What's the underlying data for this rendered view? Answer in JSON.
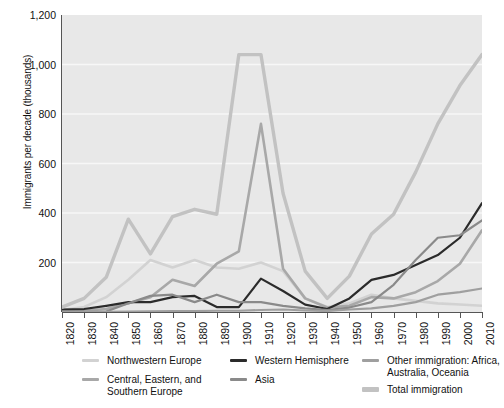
{
  "chart_data": {
    "type": "line",
    "title": "",
    "xlabel": "",
    "ylabel": "Immigrants per decade (thousands)",
    "xlim": [
      1820,
      2010
    ],
    "ylim": [
      0,
      1200
    ],
    "grid": true,
    "legend_position": "bottom",
    "x": [
      1820,
      1830,
      1840,
      1850,
      1860,
      1870,
      1880,
      1890,
      1900,
      1910,
      1920,
      1930,
      1940,
      1950,
      1960,
      1970,
      1980,
      1990,
      2000,
      2010
    ],
    "xticklabels": [
      "1820",
      "1830",
      "1840",
      "1850",
      "1860",
      "1870",
      "1880",
      "1890",
      "1900",
      "1910",
      "1920",
      "1930",
      "1940",
      "1950",
      "1960",
      "1970",
      "1980",
      "1990",
      "2000",
      "2010"
    ],
    "yticklabels": [
      "0",
      "200",
      "400",
      "600",
      "800",
      "1,000",
      "1,200"
    ],
    "ytickvalues": [
      0,
      200,
      400,
      600,
      800,
      1000,
      1200
    ],
    "series": [
      {
        "name": "Northwestern Europe",
        "color": "#d2d2d2",
        "width": 2.6,
        "values": [
          8,
          20,
          60,
          130,
          210,
          180,
          210,
          180,
          175,
          200,
          165,
          55,
          20,
          35,
          70,
          55,
          45,
          35,
          30,
          25
        ]
      },
      {
        "name": "Central, Eastern, and Southern Europe",
        "color": "#a8a8a8",
        "width": 2.6,
        "values": [
          2,
          5,
          12,
          35,
          60,
          130,
          105,
          195,
          245,
          760,
          175,
          55,
          18,
          25,
          60,
          55,
          80,
          125,
          195,
          330
        ]
      },
      {
        "name": "Western Hemisphere",
        "color": "#2b2b2b",
        "width": 2.2,
        "values": [
          10,
          12,
          25,
          40,
          40,
          60,
          65,
          20,
          20,
          135,
          85,
          30,
          12,
          55,
          130,
          150,
          190,
          230,
          300,
          440
        ]
      },
      {
        "name": "Asia",
        "color": "#8a8a8a",
        "width": 2.2,
        "values": [
          1,
          1,
          2,
          35,
          65,
          70,
          40,
          70,
          40,
          40,
          25,
          15,
          8,
          18,
          40,
          110,
          210,
          300,
          310,
          370
        ]
      },
      {
        "name": "Other immigration: Africa, Australia, Oceania",
        "color": "#9f9f9f",
        "width": 2.2,
        "values": [
          1,
          1,
          1,
          2,
          3,
          4,
          4,
          5,
          5,
          8,
          10,
          6,
          4,
          10,
          15,
          25,
          40,
          70,
          80,
          95
        ]
      },
      {
        "name": "Total immigration",
        "color": "#c2c2c2",
        "width": 3.4,
        "values": [
          20,
          55,
          140,
          375,
          235,
          385,
          415,
          395,
          1040,
          1040,
          480,
          165,
          55,
          145,
          315,
          395,
          565,
          760,
          915,
          1040
        ]
      }
    ]
  },
  "legend": {
    "columns": [
      {
        "items": [
          {
            "label": "Northwestern Europe",
            "color": "#d2d2d2",
            "thick": false
          },
          {
            "label": "Central, Eastern, and Southern Europe",
            "color": "#a8a8a8",
            "thick": false
          }
        ]
      },
      {
        "items": [
          {
            "label": "Western Hemisphere",
            "color": "#2b2b2b",
            "thick": false
          },
          {
            "label": "Asia",
            "color": "#8a8a8a",
            "thick": false
          }
        ]
      },
      {
        "items": [
          {
            "label": "Other immigration: Africa, Australia, Oceania",
            "color": "#9f9f9f",
            "thick": false
          },
          {
            "label": "Total immigration",
            "color": "#c2c2c2",
            "thick": true
          }
        ]
      }
    ]
  },
  "colors": {
    "plot_background": "#e8e8e8",
    "gridline": "#f7f7f7",
    "axis": "#555555",
    "text": "#111111"
  }
}
